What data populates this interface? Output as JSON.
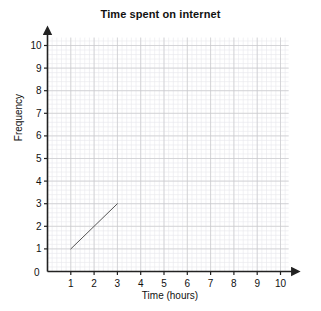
{
  "chart_data": {
    "type": "line",
    "title": "Time spent on internet",
    "xlabel": "Time (hours)",
    "ylabel": "Frequency",
    "xlim": [
      0,
      10
    ],
    "ylim": [
      0,
      10
    ],
    "xticks": [
      0,
      1,
      2,
      3,
      4,
      5,
      6,
      7,
      8,
      9,
      10
    ],
    "yticks": [
      0,
      1,
      2,
      3,
      4,
      5,
      6,
      7,
      8,
      9,
      10
    ],
    "grid": true,
    "minor_grid": true,
    "minor_divisions_per_unit": 5,
    "legend": null,
    "legend_position": "none",
    "axis_arrows": true,
    "series": [
      {
        "name": "cumulative frequency segment",
        "x": [
          1,
          3
        ],
        "values": [
          1,
          3
        ],
        "color": "#555555",
        "line_width": 1,
        "markers": false
      }
    ],
    "annotations": []
  },
  "colors": {
    "background": "#ffffff",
    "axis": "#222222",
    "text": "#111111",
    "grid_major": "#c8c8cc",
    "grid_minor": "#e8e8ec",
    "series_line": "#555555"
  },
  "labels": {
    "x_tick_labels": [
      "0",
      "1",
      "2",
      "3",
      "4",
      "5",
      "6",
      "7",
      "8",
      "9",
      "10"
    ],
    "y_tick_labels": [
      "0",
      "1",
      "2",
      "3",
      "4",
      "5",
      "6",
      "7",
      "8",
      "9",
      "10"
    ]
  }
}
